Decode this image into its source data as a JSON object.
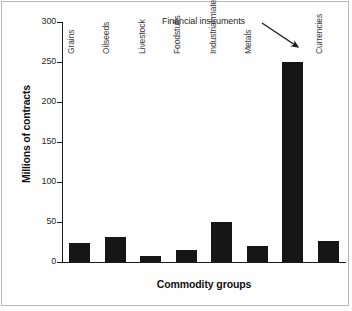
{
  "chart_data": {
    "type": "bar",
    "title": "",
    "subtitle": "",
    "xlabel": "Commodity groups",
    "ylabel": "Millions of contracts",
    "categories": [
      "Grains",
      "Oilseeds",
      "Livestock",
      "Foodstuffs",
      "Industrial materials",
      "Metals",
      "Financial instruments",
      "Currencies"
    ],
    "values": [
      24,
      31,
      8,
      15,
      50,
      20,
      250,
      26
    ],
    "ylim": [
      0,
      300
    ],
    "yticks": [
      0,
      50,
      100,
      150,
      200,
      250,
      300
    ],
    "ytick_labels": [
      "0",
      "50",
      "100",
      "150",
      "200",
      "250",
      "300"
    ],
    "grid": false,
    "legend": null,
    "bar_color": "#161616",
    "annotations": [
      {
        "text": "Financial instruments",
        "points_to_category": "Financial instruments",
        "arrow": "down-right"
      }
    ],
    "category_label_rotation": -90,
    "category_labels_inside_plot": true
  },
  "axes": {
    "y_title": "Millions of contracts",
    "x_title": "Commodity groups"
  },
  "icons": {
    "arrow": "arrow-down-right-icon"
  },
  "colors": {
    "bar": "#161616",
    "axis": "#1b1b1b",
    "text": "#2a2a2a",
    "frame": "#b9b9b9",
    "background": "#ffffff"
  }
}
